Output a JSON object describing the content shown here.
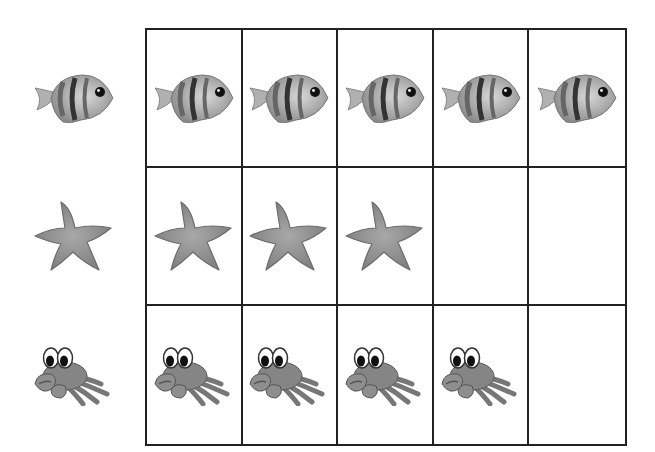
{
  "title": "Picture count grid",
  "rows": [
    {
      "name": "fish",
      "label": "Fish",
      "icon": "fish-icon",
      "count": 5
    },
    {
      "name": "starfish",
      "label": "Starfish",
      "icon": "starfish-icon",
      "count": 3
    },
    {
      "name": "crab",
      "label": "Crab",
      "icon": "crab-icon",
      "count": 4
    }
  ],
  "grid": {
    "columns": 5,
    "rows": 3
  },
  "colors": {
    "line": "#222222",
    "icon_fill": "#9a9a9a",
    "icon_dark": "#555555"
  }
}
